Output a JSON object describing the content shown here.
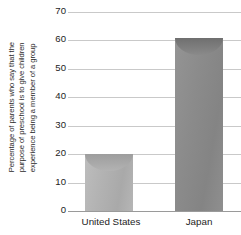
{
  "chart_data": {
    "type": "bar",
    "title": "",
    "subtitle": "",
    "xlabel": "",
    "ylabel": "Percentage of parents who say that the purpose of preschool is to give children experience being a member of a group",
    "ylabel_lines": [
      "Percentage of parents who say that the",
      "purpose of preschool is to give children",
      "experience being a member of a group"
    ],
    "categories": [
      "United States",
      "Japan"
    ],
    "values": [
      20,
      61
    ],
    "ylim": [
      0,
      70
    ],
    "yticks": [
      0,
      10,
      20,
      30,
      40,
      50,
      60,
      70
    ],
    "ytick_labels": [
      "0",
      "10",
      "20",
      "30",
      "40",
      "50",
      "60",
      "70"
    ],
    "grid": true,
    "grid_axis": "y",
    "legend": false,
    "legend_position": "none",
    "series": [
      {
        "name": "Percentage of parents",
        "values": [
          20,
          61
        ]
      }
    ],
    "bar_style": "cylinder-3d",
    "colors": {
      "bar_united_states": "#b0b0b0",
      "bar_japan": "#8a8a8a",
      "gridline": "#c9c9c9",
      "axis": "#9a9a9a",
      "text": "#1d1d1d",
      "background": "#ffffff"
    }
  },
  "axis": {
    "y_title_lines": [
      "Percentage of parents who say that the",
      "purpose of preschool is to give children",
      "experience being a member of a group"
    ],
    "y_ticks": [
      "0",
      "10",
      "20",
      "30",
      "40",
      "50",
      "60",
      "70"
    ]
  },
  "bars": [
    {
      "label": "United States",
      "value": 20
    },
    {
      "label": "Japan",
      "value": 61
    }
  ]
}
